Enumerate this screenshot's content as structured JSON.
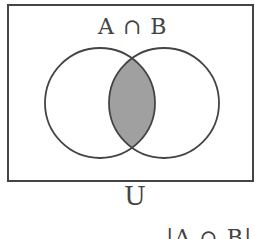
{
  "diagram": {
    "type": "venn",
    "title": "A ∩ B",
    "universe_label": "U",
    "caption": "|A ∩ B|",
    "sets": [
      {
        "name": "A",
        "position": "left"
      },
      {
        "name": "B",
        "position": "right"
      }
    ],
    "highlighted_region": "A ∩ B",
    "colors": {
      "stroke": "#444444",
      "highlight_fill": "#a0a0a0",
      "background": "#ffffff"
    }
  }
}
